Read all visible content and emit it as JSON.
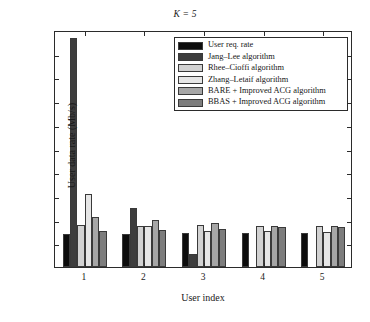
{
  "chart_data": {
    "type": "bar",
    "title": "K = 5",
    "xlabel": "User index",
    "ylabel": "User data rate (Mb/s)",
    "categories": [
      "1",
      "2",
      "3",
      "4",
      "5"
    ],
    "ylim": [
      0,
      10
    ],
    "yticks": [
      0,
      1,
      2,
      3,
      4,
      5,
      6,
      7,
      8,
      9,
      10
    ],
    "ytick_labels": [
      "0",
      "1",
      "2",
      "3",
      "4",
      "5",
      "6",
      "7",
      "8",
      "9",
      "10"
    ],
    "grid": false,
    "legend_position": "top-right-inside",
    "series": [
      {
        "name": "User req. rate",
        "color": "#0d0d0d",
        "values": [
          1.4,
          1.41,
          1.43,
          1.44,
          1.45
        ]
      },
      {
        "name": "Jang–Lee algorithm",
        "color": "#3d3d3d",
        "values": [
          9.66,
          2.48,
          0.55,
          0.0,
          0.0
        ]
      },
      {
        "name": "Rhee–Cioffi algorithm",
        "color": "#d2d2d2",
        "values": [
          1.77,
          1.75,
          1.76,
          1.73,
          1.74
        ]
      },
      {
        "name": "Zhang–Letaif algorithm",
        "color": "#e6e6e6",
        "values": [
          3.06,
          1.73,
          1.53,
          1.52,
          1.48
        ]
      },
      {
        "name": "BARE + Improved ACG algorithm",
        "color": "#a6a6a6",
        "values": [
          2.09,
          1.98,
          1.87,
          1.74,
          1.72
        ]
      },
      {
        "name": "BBAS + Improved ACG algorithm",
        "color": "#7d7d7d",
        "values": [
          1.54,
          1.57,
          1.61,
          1.69,
          1.69
        ]
      }
    ]
  },
  "axes": {
    "frame_color": "#2b2b2b"
  }
}
